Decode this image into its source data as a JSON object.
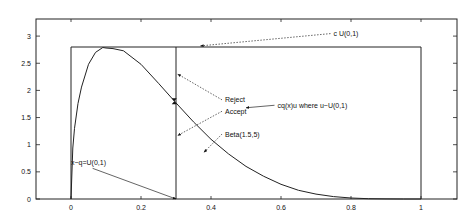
{
  "chart_data": {
    "type": "line",
    "title": "",
    "xlabel": "",
    "ylabel": "",
    "xlim": [
      -0.1,
      1.1
    ],
    "ylim": [
      0,
      3.2
    ],
    "grid": false,
    "x_ticks": [
      "0",
      "0.2",
      "0.4",
      "0.6",
      "0.8",
      "1"
    ],
    "x_tick_values": [
      0,
      0.2,
      0.4,
      0.6,
      0.8,
      1
    ],
    "y_ticks": [
      "0",
      "0.5",
      "1",
      "1.5",
      "2",
      "2.5",
      "3"
    ],
    "y_tick_values": [
      0,
      0.5,
      1,
      1.5,
      2,
      2.5,
      3
    ],
    "series": [
      {
        "name": "Beta(1.5,5)",
        "x": [
          0,
          0.005,
          0.01,
          0.02,
          0.03,
          0.05,
          0.07,
          0.0909,
          0.1,
          0.12,
          0.15,
          0.2,
          0.25,
          0.3,
          0.35,
          0.4,
          0.45,
          0.5,
          0.55,
          0.6,
          0.65,
          0.7,
          0.75,
          0.8,
          0.85,
          0.9,
          0.95,
          1.0
        ],
        "y": [
          0,
          0.94,
          1.3,
          1.76,
          2.06,
          2.48,
          2.7,
          2.79,
          2.78,
          2.77,
          2.73,
          2.48,
          2.13,
          1.77,
          1.42,
          1.1,
          0.83,
          0.6,
          0.42,
          0.27,
          0.16,
          0.09,
          0.044,
          0.019,
          0.0063,
          0.0013,
          0.0001,
          0
        ]
      },
      {
        "name": "c U(0,1)",
        "x": [
          0,
          0,
          1,
          1
        ],
        "y": [
          0,
          2.8,
          2.8,
          0
        ]
      },
      {
        "name": "x~q=U(0,1)",
        "x": [
          0.3,
          0.3
        ],
        "y": [
          0,
          2.8
        ]
      }
    ],
    "marker": {
      "x": 0.295,
      "y": 1.8,
      "label": "cq(x)u where u~U(0,1)"
    },
    "annotations": [
      {
        "text": "c U(0,1)",
        "text_x": 0.75,
        "text_y": 3.0,
        "arrow_to_x": 0.37,
        "arrow_to_y": 2.82
      },
      {
        "text": "Reject",
        "text_x": 0.44,
        "text_y": 1.78,
        "arrow_to_x": 0.305,
        "arrow_to_y": 2.3
      },
      {
        "text": "Accept",
        "text_x": 0.44,
        "text_y": 1.57,
        "arrow_to_x": 0.305,
        "arrow_to_y": 1.17
      },
      {
        "text": "cq(x)u where u~U(0,1)",
        "text_x": 0.59,
        "text_y": 1.68,
        "arrow_to_x": 0.5,
        "arrow_to_y": 1.68
      },
      {
        "text": "Beta(1.5,5)",
        "text_x": 0.44,
        "text_y": 1.15,
        "arrow_to_x": 0.38,
        "arrow_to_y": 0.86
      },
      {
        "text": "x~q=U(0,1)",
        "text_x": 0.0,
        "text_y": 0.62,
        "arrow_to_x": 0.3,
        "arrow_to_y": 0.0
      }
    ]
  }
}
